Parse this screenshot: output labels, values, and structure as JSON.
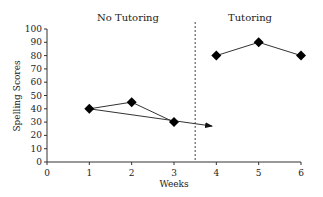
{
  "chart_data": {
    "type": "line",
    "title": "",
    "xlabel": "Weeks",
    "ylabel": "Spelling Scores",
    "xlim": [
      0,
      6
    ],
    "ylim": [
      0,
      100
    ],
    "x_ticks": [
      "0",
      "1",
      "2",
      "3",
      "4",
      "5",
      "6"
    ],
    "y_ticks": [
      "0",
      "10",
      "20",
      "30",
      "40",
      "50",
      "60",
      "70",
      "80",
      "90",
      "100"
    ],
    "grid": false,
    "legend": null,
    "phase_labels": [
      {
        "text": "No Tutoring",
        "x": 2
      },
      {
        "text": "Tutoring",
        "x": 5
      }
    ],
    "phase_change_line": {
      "x": 3.5,
      "style": "dashed"
    },
    "series": [
      {
        "name": "No Tutoring",
        "x": [
          1,
          2,
          3
        ],
        "values": [
          40,
          45,
          30
        ],
        "marker": "diamond"
      },
      {
        "name": "Tutoring",
        "x": [
          4,
          5,
          6
        ],
        "values": [
          80,
          90,
          80
        ],
        "marker": "diamond"
      }
    ],
    "annotations": [
      {
        "type": "trend-arrow",
        "from": [
          1,
          40
        ],
        "to": [
          3.9,
          27
        ]
      }
    ]
  }
}
